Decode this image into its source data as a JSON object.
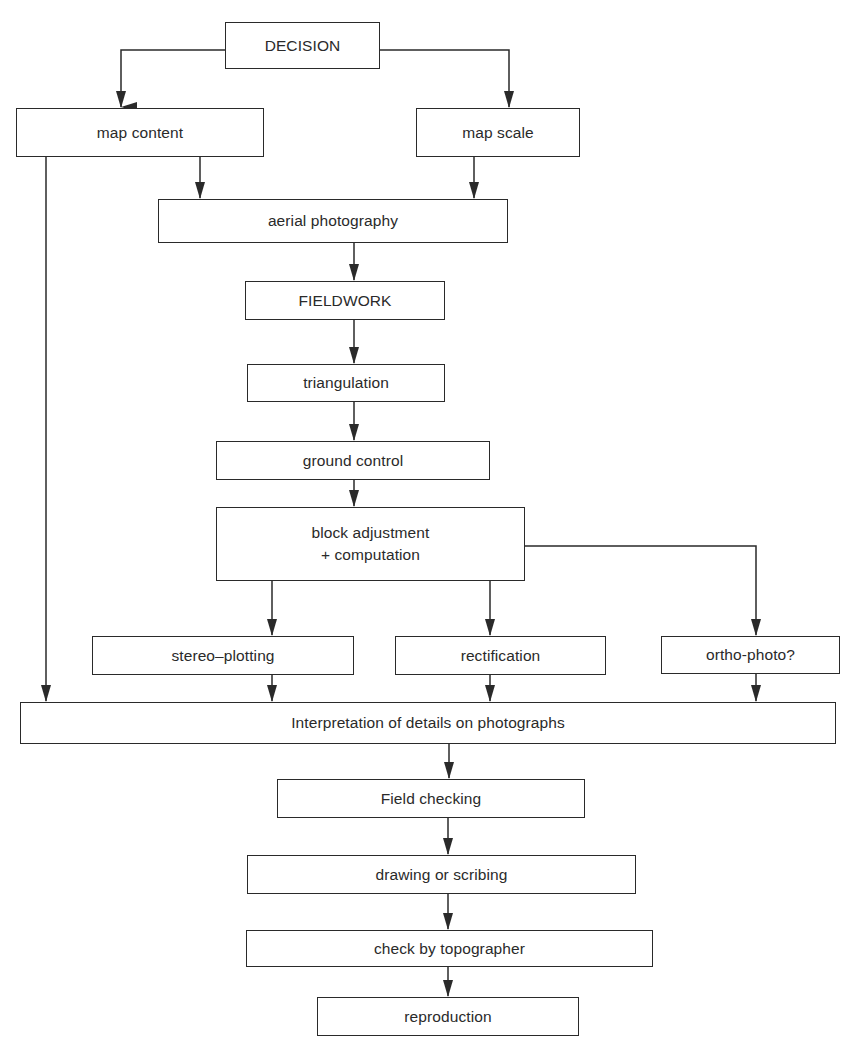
{
  "diagram": {
    "type": "flowchart",
    "nodes": {
      "decision": {
        "label": "DECISION"
      },
      "map_content": {
        "label": "map content"
      },
      "map_scale": {
        "label": "map scale"
      },
      "aerial_photography": {
        "label": "aerial photography"
      },
      "fieldwork": {
        "label": "FIELDWORK"
      },
      "triangulation": {
        "label": "triangulation"
      },
      "ground_control": {
        "label": "ground control"
      },
      "block_adjustment": {
        "label": "block adjustment\n+ computation"
      },
      "stereo_plotting": {
        "label": "stereo–plotting"
      },
      "rectification": {
        "label": "rectification"
      },
      "ortho_photo": {
        "label": "ortho-photo?"
      },
      "interpretation": {
        "label": "Interpretation of details on photographs"
      },
      "field_checking": {
        "label": "Field checking"
      },
      "drawing_or_scribing": {
        "label": "drawing or scribing"
      },
      "check_by_topographer": {
        "label": "check by topographer"
      },
      "reproduction": {
        "label": "reproduction"
      }
    },
    "edges": [
      [
        "decision",
        "map_content"
      ],
      [
        "decision",
        "map_scale"
      ],
      [
        "map_content",
        "aerial_photography"
      ],
      [
        "map_scale",
        "aerial_photography"
      ],
      [
        "map_content",
        "interpretation"
      ],
      [
        "aerial_photography",
        "fieldwork"
      ],
      [
        "fieldwork",
        "triangulation"
      ],
      [
        "triangulation",
        "ground_control"
      ],
      [
        "ground_control",
        "block_adjustment"
      ],
      [
        "block_adjustment",
        "stereo_plotting"
      ],
      [
        "block_adjustment",
        "rectification"
      ],
      [
        "block_adjustment",
        "ortho_photo"
      ],
      [
        "stereo_plotting",
        "interpretation"
      ],
      [
        "rectification",
        "interpretation"
      ],
      [
        "ortho_photo",
        "interpretation"
      ],
      [
        "interpretation",
        "field_checking"
      ],
      [
        "field_checking",
        "drawing_or_scribing"
      ],
      [
        "drawing_or_scribing",
        "check_by_topographer"
      ],
      [
        "check_by_topographer",
        "reproduction"
      ]
    ],
    "colors": {
      "stroke": "#2a2a2a",
      "background": "#ffffff"
    }
  }
}
